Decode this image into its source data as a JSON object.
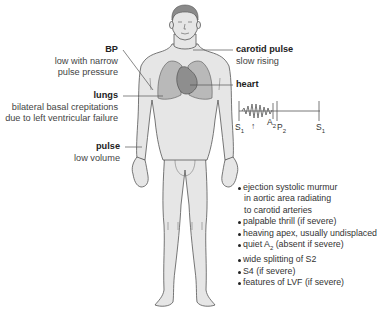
{
  "figure": {
    "colors": {
      "skin": "#e6e6e6",
      "outline": "#555555",
      "hair": "#8a8a8a",
      "lungs": "#b9b9b9",
      "heart": "#8e8e8e",
      "leader": "#555555"
    }
  },
  "labels": {
    "bp": {
      "title": "BP",
      "desc_line1": "low with narrow",
      "desc_line2": "pulse pressure"
    },
    "lungs": {
      "title": "lungs",
      "desc_line1": "bilateral basal crepitations",
      "desc_line2": "due to left ventricular failure"
    },
    "pulse": {
      "title": "pulse",
      "desc_line1": "low volume"
    },
    "carotid": {
      "title": "carotid pulse",
      "desc_line1": "slow rising"
    },
    "heart": {
      "title": "heart"
    }
  },
  "phonocardiogram": {
    "s1_left": "S",
    "s1_left_sub": "1",
    "arrow": "↑",
    "a2": "A",
    "a2_sub": "2",
    "p2": "P",
    "p2_sub": "2",
    "s1_right": "S",
    "s1_right_sub": "1"
  },
  "heart_findings": [
    {
      "text": "ejection systolic murmur",
      "cont": [
        "in aortic area radiating",
        "to carotid arteries"
      ]
    },
    {
      "text": "palpable thrill (if severe)"
    },
    {
      "text": "heaving apex, usually undisplaced"
    },
    {
      "text_pre": "quiet A",
      "text_sub": "2",
      "text_post": " (absent if severe)"
    },
    {
      "text": "wide splitting of S2"
    },
    {
      "text": "S4 (if severe)"
    },
    {
      "text": "features of LVF (if severe)"
    }
  ]
}
